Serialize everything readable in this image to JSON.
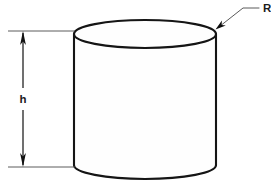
{
  "figure": {
    "background_color": "#ffffff",
    "line_color": "#151515",
    "thin_line_color": "#4a4a4a",
    "width": 271,
    "height": 188
  },
  "labels": {
    "height_label": "h",
    "radius_label": "R"
  },
  "shape": {
    "name": "cylinder",
    "left_x": 74,
    "right_x": 216,
    "top_ellipse_center_y": 34,
    "top_ellipse_ry": 14,
    "bottom_ellipse_center_y": 165,
    "bottom_ellipse_ry": 14
  },
  "dimension": {
    "name": "height-dimension",
    "axis_x": 23,
    "top_y": 31,
    "bottom_y": 167,
    "extension_left_x": 8,
    "extension_right_x": 75,
    "arrow_style": "double-headed"
  },
  "leader": {
    "name": "radius-leader",
    "arrow_tip_x": 216,
    "arrow_tip_y": 29,
    "bend_x": 243,
    "bend_y": 8,
    "end_x": 259,
    "end_y": 8
  }
}
